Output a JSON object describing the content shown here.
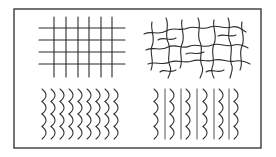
{
  "figure": {
    "frame": {
      "x": 14,
      "y": 9,
      "width": 247,
      "height": 139,
      "stroke": "#3a3a3a"
    },
    "panels": [
      {
        "id": "grid",
        "position": "top-left",
        "pattern": "orthogonal grid",
        "vertical_lines_x": [
          54,
          66,
          78,
          89,
          101,
          112
        ],
        "vertical_span_y": [
          17,
          77
        ],
        "horizontal_lines_y": [
          28,
          40,
          52,
          64
        ],
        "horizontal_span_x": [
          39,
          125
        ]
      },
      {
        "id": "network",
        "position": "top-right",
        "pattern": "irregular wavy network"
      },
      {
        "id": "arc-array",
        "position": "bottom-left",
        "pattern": "columns of stacked right-bulging arcs",
        "columns": 9,
        "rows": 4,
        "origin_x": 42,
        "origin_y": 89,
        "col_spacing": 9,
        "row_spacing": 12.5
      },
      {
        "id": "arc-line-alternating",
        "position": "bottom-right",
        "pattern": "alternating columns of stacked arcs and straight vertical lines",
        "arc_columns_x": [
          154,
          170,
          186,
          203,
          219,
          234
        ],
        "straight_lines_x": [
          165,
          181,
          197,
          214,
          229
        ],
        "rows": 4,
        "span_y": [
          89,
          139
        ]
      }
    ],
    "colors": {
      "line": "#2b2b2b",
      "background": "#ffffff"
    }
  }
}
